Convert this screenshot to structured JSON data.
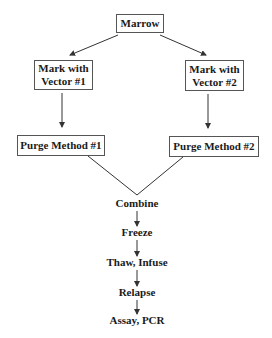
{
  "diagram": {
    "type": "flowchart",
    "nodes": {
      "marrow": "Marrow",
      "mark1_line1": "Mark with",
      "mark1_line2": "Vector #1",
      "mark2_line1": "Mark with",
      "mark2_line2": "Vector #2",
      "purge1": "Purge Method #1",
      "purge2": "Purge Method #2",
      "combine": "Combine",
      "freeze": "Freeze",
      "thaw": "Thaw, Infuse",
      "relapse": "Relapse",
      "assay": "Assay, PCR"
    },
    "edges": [
      [
        "Marrow",
        "Mark with Vector #1"
      ],
      [
        "Marrow",
        "Mark with Vector #2"
      ],
      [
        "Mark with Vector #1",
        "Purge Method #1"
      ],
      [
        "Mark with Vector #2",
        "Purge Method #2"
      ],
      [
        "Purge Method #1",
        "Combine"
      ],
      [
        "Purge Method #2",
        "Combine"
      ],
      [
        "Combine",
        "Freeze"
      ],
      [
        "Freeze",
        "Thaw, Infuse"
      ],
      [
        "Thaw, Infuse",
        "Relapse"
      ],
      [
        "Relapse",
        "Assay, PCR"
      ]
    ],
    "colors": {
      "line": "#333333",
      "box_border": "#555555",
      "text": "#1a1a1a"
    }
  }
}
